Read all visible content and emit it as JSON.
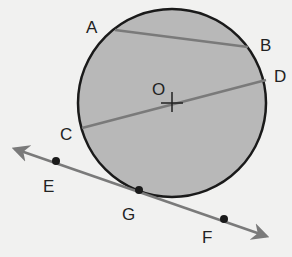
{
  "diagram": {
    "circle": {
      "center_label": "O",
      "fill": "#b8b8b8",
      "stroke": "#1a1a1a"
    },
    "labels": {
      "A": "A",
      "B": "B",
      "C": "C",
      "D": "D",
      "E": "E",
      "F": "F",
      "G": "G",
      "O": "O"
    },
    "segments": [
      {
        "name": "chord AB",
        "from": "A",
        "to": "B"
      },
      {
        "name": "diameter CD",
        "from": "C",
        "to": "D"
      }
    ],
    "tangent_line": {
      "name": "line EF",
      "points": [
        "E",
        "G",
        "F"
      ],
      "tangent_point": "G"
    },
    "colors": {
      "line": "#7a7a7a",
      "circle_fill": "#b8b8b8",
      "outline": "#1a1a1a",
      "background": "#f1f1f0"
    }
  }
}
